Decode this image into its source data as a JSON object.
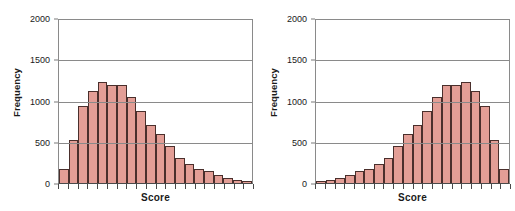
{
  "figure": {
    "panels": [
      {
        "id": "left",
        "name": "right-skewed-histogram",
        "xlabel": "Score",
        "ylabel": "Frequency"
      },
      {
        "id": "right",
        "name": "left-skewed-histogram",
        "xlabel": "Score",
        "ylabel": "Frequency"
      }
    ],
    "bar_fill": "#e39e96",
    "bar_stroke": "#4a2f2c",
    "grid_color": "#8a8a8a",
    "axis_color": "#4a4a4a"
  },
  "chart_data": [
    {
      "type": "bar",
      "title": "",
      "subtitle": "",
      "xlabel": "Score",
      "ylabel": "Frequency",
      "ylim": [
        0,
        2000
      ],
      "yticks": [
        0,
        500,
        1000,
        1500,
        2000
      ],
      "ytick_labels": [
        "0",
        "500",
        "1000",
        "1500",
        "2000"
      ],
      "grid": "horizontal",
      "legend": "none",
      "skew": "right-skewed",
      "n_bins": 20,
      "categories": [
        "1",
        "2",
        "3",
        "4",
        "5",
        "6",
        "7",
        "8",
        "9",
        "10",
        "11",
        "12",
        "13",
        "14",
        "15",
        "16",
        "17",
        "18",
        "19",
        "20"
      ],
      "values": [
        175,
        520,
        930,
        1120,
        1220,
        1190,
        1190,
        1045,
        875,
        705,
        595,
        450,
        300,
        230,
        165,
        145,
        95,
        55,
        35,
        20
      ]
    },
    {
      "type": "bar",
      "title": "",
      "subtitle": "",
      "xlabel": "Score",
      "ylabel": "Frequency",
      "ylim": [
        0,
        2000
      ],
      "yticks": [
        0,
        500,
        1000,
        1500,
        2000
      ],
      "ytick_labels": [
        "0",
        "500",
        "1000",
        "1500",
        "2000"
      ],
      "grid": "horizontal",
      "legend": "none",
      "skew": "left-skewed",
      "n_bins": 20,
      "categories": [
        "1",
        "2",
        "3",
        "4",
        "5",
        "6",
        "7",
        "8",
        "9",
        "10",
        "11",
        "12",
        "13",
        "14",
        "15",
        "16",
        "17",
        "18",
        "19",
        "20"
      ],
      "values": [
        20,
        35,
        55,
        95,
        145,
        165,
        230,
        300,
        450,
        595,
        705,
        875,
        1045,
        1190,
        1190,
        1220,
        1120,
        930,
        520,
        175
      ]
    }
  ]
}
